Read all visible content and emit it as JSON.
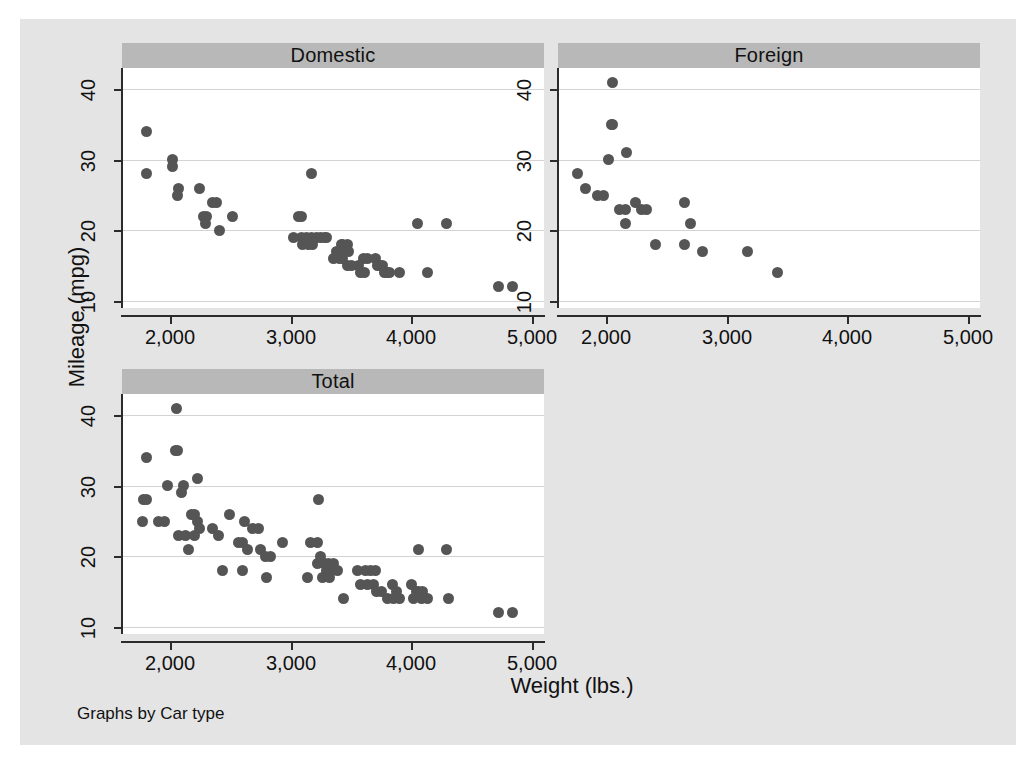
{
  "figure": {
    "y_axis_title": "Mileage (mpg)",
    "x_axis_title": "Weight (lbs.)",
    "footer_note": "Graphs by Car type",
    "background_color": "#e4e4e4",
    "panel_header_color": "#b8b8b8",
    "marker_color": "#555555",
    "gridline_color": "#d3d3d3",
    "axis_color": "#2b2b2b"
  },
  "chart_data": {
    "type": "scatter",
    "title": "Graphs by Car type",
    "xlabel": "Weight (lbs.)",
    "ylabel": "Mileage (mpg)",
    "xlim": [
      1600,
      5100
    ],
    "ylim": [
      9,
      43
    ],
    "xticks": [
      2000,
      3000,
      4000,
      5000
    ],
    "xticklabels": [
      "2,000",
      "3,000",
      "4,000",
      "5,000"
    ],
    "yticks": [
      10,
      20,
      30,
      40
    ],
    "yticklabels": [
      "10",
      "20",
      "30",
      "40"
    ],
    "grid": "horizontal",
    "legend": "none",
    "panels": [
      {
        "name": "Domestic",
        "label": "Domestic",
        "points": [
          [
            1800,
            34
          ],
          [
            1800,
            28
          ],
          [
            2020,
            30
          ],
          [
            2020,
            29
          ],
          [
            2070,
            26
          ],
          [
            2060,
            25
          ],
          [
            2240,
            26
          ],
          [
            2350,
            24
          ],
          [
            2380,
            24
          ],
          [
            2280,
            22
          ],
          [
            2300,
            22
          ],
          [
            2290,
            21
          ],
          [
            2410,
            20
          ],
          [
            2520,
            22
          ],
          [
            3170,
            28
          ],
          [
            3060,
            22
          ],
          [
            3090,
            22
          ],
          [
            3020,
            19
          ],
          [
            3090,
            19
          ],
          [
            3130,
            19
          ],
          [
            3170,
            19
          ],
          [
            3180,
            18
          ],
          [
            3210,
            19
          ],
          [
            3250,
            19
          ],
          [
            3280,
            19
          ],
          [
            3300,
            19
          ],
          [
            3100,
            18
          ],
          [
            3150,
            18
          ],
          [
            3420,
            18
          ],
          [
            3430,
            18
          ],
          [
            3470,
            18
          ],
          [
            3380,
            17
          ],
          [
            3440,
            17
          ],
          [
            3480,
            17
          ],
          [
            3350,
            16
          ],
          [
            3400,
            16
          ],
          [
            3430,
            16
          ],
          [
            3470,
            15
          ],
          [
            3500,
            15
          ],
          [
            3600,
            16
          ],
          [
            3640,
            16
          ],
          [
            3560,
            15
          ],
          [
            3580,
            14
          ],
          [
            3610,
            14
          ],
          [
            3700,
            16
          ],
          [
            3720,
            15
          ],
          [
            3740,
            15
          ],
          [
            3760,
            15
          ],
          [
            3780,
            14
          ],
          [
            3800,
            14
          ],
          [
            3820,
            14
          ],
          [
            3900,
            14
          ],
          [
            4050,
            21
          ],
          [
            4290,
            21
          ],
          [
            4130,
            14
          ],
          [
            4720,
            12
          ],
          [
            4840,
            12
          ]
        ]
      },
      {
        "name": "Foreign",
        "label": "Foreign",
        "points": [
          [
            2050,
            41
          ],
          [
            2040,
            35
          ],
          [
            2050,
            35
          ],
          [
            2170,
            31
          ],
          [
            2020,
            30
          ],
          [
            1760,
            28
          ],
          [
            1830,
            26
          ],
          [
            1930,
            25
          ],
          [
            1980,
            25
          ],
          [
            2240,
            24
          ],
          [
            2290,
            23
          ],
          [
            2330,
            23
          ],
          [
            2110,
            23
          ],
          [
            2160,
            23
          ],
          [
            2160,
            21
          ],
          [
            2650,
            24
          ],
          [
            2700,
            21
          ],
          [
            2410,
            18
          ],
          [
            2650,
            18
          ],
          [
            2800,
            17
          ],
          [
            3170,
            17
          ],
          [
            3420,
            14
          ]
        ]
      },
      {
        "name": "Total",
        "label": "Total",
        "points": [
          [
            2050,
            41
          ],
          [
            1800,
            34
          ],
          [
            2040,
            35
          ],
          [
            2060,
            35
          ],
          [
            2230,
            31
          ],
          [
            1980,
            30
          ],
          [
            2110,
            30
          ],
          [
            2090,
            29
          ],
          [
            1780,
            28
          ],
          [
            1800,
            28
          ],
          [
            2180,
            26
          ],
          [
            2200,
            26
          ],
          [
            2490,
            26
          ],
          [
            1770,
            25
          ],
          [
            1900,
            25
          ],
          [
            1950,
            25
          ],
          [
            2230,
            25
          ],
          [
            2240,
            24
          ],
          [
            2350,
            24
          ],
          [
            2620,
            25
          ],
          [
            2680,
            24
          ],
          [
            2730,
            24
          ],
          [
            2070,
            23
          ],
          [
            2130,
            23
          ],
          [
            2200,
            23
          ],
          [
            2400,
            23
          ],
          [
            2150,
            21
          ],
          [
            2570,
            22
          ],
          [
            2600,
            22
          ],
          [
            2640,
            21
          ],
          [
            2750,
            21
          ],
          [
            2790,
            20
          ],
          [
            2830,
            20
          ],
          [
            2930,
            22
          ],
          [
            3160,
            22
          ],
          [
            3220,
            22
          ],
          [
            3230,
            28
          ],
          [
            3140,
            17
          ],
          [
            3220,
            19
          ],
          [
            3250,
            20
          ],
          [
            3280,
            19
          ],
          [
            3310,
            19
          ],
          [
            3350,
            19
          ],
          [
            3300,
            18
          ],
          [
            3340,
            18
          ],
          [
            3390,
            18
          ],
          [
            3260,
            17
          ],
          [
            3320,
            17
          ],
          [
            2430,
            18
          ],
          [
            2600,
            18
          ],
          [
            2800,
            17
          ],
          [
            3440,
            14
          ],
          [
            3550,
            18
          ],
          [
            3620,
            18
          ],
          [
            3660,
            18
          ],
          [
            3700,
            18
          ],
          [
            3580,
            16
          ],
          [
            3640,
            16
          ],
          [
            3690,
            16
          ],
          [
            3710,
            15
          ],
          [
            3750,
            15
          ],
          [
            3840,
            16
          ],
          [
            3880,
            15
          ],
          [
            3800,
            14
          ],
          [
            3850,
            14
          ],
          [
            3900,
            14
          ],
          [
            4000,
            16
          ],
          [
            4040,
            15
          ],
          [
            4060,
            15
          ],
          [
            4090,
            15
          ],
          [
            4020,
            14
          ],
          [
            4080,
            14
          ],
          [
            4130,
            14
          ],
          [
            4060,
            21
          ],
          [
            4290,
            21
          ],
          [
            4310,
            14
          ],
          [
            4720,
            12
          ],
          [
            4840,
            12
          ]
        ]
      }
    ]
  },
  "panel_geometry": [
    {
      "name": "Domestic",
      "left": 102,
      "top": 24,
      "width": 422,
      "height": 265,
      "plot_height": 240
    },
    {
      "name": "Foreign",
      "left": 538,
      "top": 24,
      "width": 422,
      "height": 265,
      "plot_height": 240
    },
    {
      "name": "Total",
      "left": 102,
      "top": 350,
      "width": 422,
      "height": 265,
      "plot_height": 240
    }
  ]
}
